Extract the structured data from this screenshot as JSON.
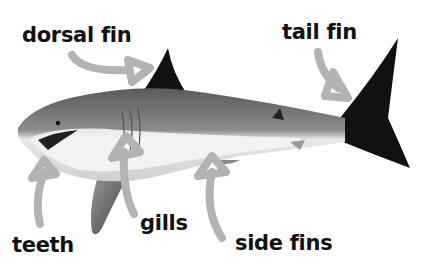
{
  "diagram": {
    "labels": {
      "dorsal_fin": "dorsal fin",
      "tail_fin": "tail fin",
      "teeth": "teeth",
      "gills": "gills",
      "side_fins": "side fins"
    },
    "colors": {
      "text": "#111111",
      "arrow": "#b3b3b3",
      "background": "#ffffff",
      "fin_dark": "#111111",
      "body_grey": "#7a7a7a",
      "belly": "#f2f2f2"
    }
  }
}
